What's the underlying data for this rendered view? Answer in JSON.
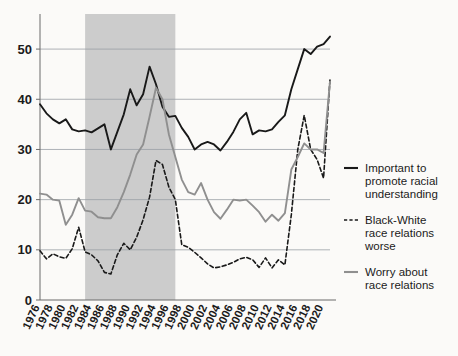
{
  "chart_data": {
    "type": "line",
    "title": "",
    "subtitle": "",
    "xlabel": "",
    "ylabel": "",
    "xlim": [
      1976,
      2021
    ],
    "ylim": [
      0,
      55
    ],
    "yticks": [
      0,
      10,
      20,
      30,
      40,
      50
    ],
    "ytick_labels": [
      "0",
      "10",
      "20",
      "30",
      "40",
      "50"
    ],
    "xticks": [
      1976,
      1978,
      1980,
      1982,
      1984,
      1986,
      1988,
      1990,
      1992,
      1994,
      1996,
      1998,
      2000,
      2002,
      2004,
      2006,
      2008,
      2010,
      2012,
      2014,
      2016,
      2018,
      2020
    ],
    "xtick_labels": [
      "1976",
      "1978",
      "1980",
      "1982",
      "1984",
      "1986",
      "1988",
      "1990",
      "1992",
      "1994",
      "1996",
      "1998",
      "2000",
      "2002",
      "2004",
      "2006",
      "2008",
      "2010",
      "2012",
      "2014",
      "2016",
      "2018",
      "2020"
    ],
    "grid": "horizontal",
    "legend_position": "right",
    "shaded_band": {
      "label": "",
      "x_start": 1983,
      "x_end": 1997,
      "color": "#cccccc"
    },
    "series": [
      {
        "name": "Important to promote racial understanding",
        "style": "solid",
        "color": "#191919",
        "x": [
          1976,
          1977,
          1978,
          1979,
          1980,
          1981,
          1982,
          1983,
          1984,
          1985,
          1986,
          1987,
          1988,
          1989,
          1990,
          1991,
          1992,
          1993,
          1994,
          1995,
          1996,
          1997,
          1998,
          1999,
          2000,
          2001,
          2002,
          2003,
          2004,
          2005,
          2006,
          2007,
          2008,
          2009,
          2010,
          2011,
          2012,
          2013,
          2014,
          2015,
          2016,
          2017,
          2018,
          2019,
          2020,
          2021
        ],
        "y": [
          39.0,
          37.2,
          36.0,
          35.2,
          36.0,
          34.0,
          33.6,
          33.8,
          33.4,
          34.2,
          35.0,
          30.0,
          33.5,
          37.0,
          42.0,
          38.8,
          41.0,
          46.5,
          43.0,
          38.5,
          36.5,
          36.7,
          34.3,
          32.5,
          30.0,
          31.0,
          31.5,
          31.0,
          29.8,
          31.5,
          33.5,
          36.0,
          37.3,
          33.0,
          33.8,
          33.6,
          34.0,
          35.5,
          36.8,
          42.0,
          46.0,
          50.0,
          49.0,
          50.5,
          51.0,
          52.5
        ]
      },
      {
        "name": "Black-White race relations worse",
        "style": "dashed",
        "color": "#191919",
        "x": [
          1976,
          1977,
          1978,
          1979,
          1980,
          1981,
          1982,
          1983,
          1984,
          1985,
          1986,
          1987,
          1988,
          1989,
          1990,
          1991,
          1992,
          1993,
          1994,
          1995,
          1996,
          1997,
          1998,
          1999,
          2000,
          2001,
          2002,
          2003,
          2004,
          2005,
          2006,
          2007,
          2008,
          2009,
          2010,
          2011,
          2012,
          2013,
          2014,
          2015,
          2016,
          2017,
          2018,
          2019,
          2020,
          2021
        ],
        "y": [
          9.8,
          8.2,
          9.2,
          8.6,
          8.3,
          10.2,
          14.5,
          9.6,
          9.0,
          7.8,
          5.5,
          5.2,
          9.0,
          11.3,
          10.0,
          12.5,
          16.0,
          20.5,
          27.8,
          27.0,
          22.5,
          20.0,
          11.0,
          10.5,
          9.5,
          8.4,
          7.2,
          6.4,
          6.6,
          7.0,
          7.5,
          8.2,
          8.5,
          8.0,
          6.5,
          8.4,
          6.4,
          8.0,
          7.0,
          17.0,
          30.0,
          36.8,
          30.0,
          28.0,
          24.3,
          44.0
        ]
      },
      {
        "name": "Worry about race relations",
        "style": "solid",
        "color": "#8f8f8f",
        "x": [
          1976,
          1977,
          1978,
          1979,
          1980,
          1981,
          1982,
          1983,
          1984,
          1985,
          1986,
          1987,
          1988,
          1989,
          1990,
          1991,
          1992,
          1993,
          1994,
          1995,
          1996,
          1997,
          1998,
          1999,
          2000,
          2001,
          2002,
          2003,
          2004,
          2005,
          2006,
          2007,
          2008,
          2009,
          2010,
          2011,
          2012,
          2013,
          2014,
          2015,
          2016,
          2017,
          2018,
          2019,
          2020,
          2021
        ],
        "y": [
          21.2,
          21.0,
          20.0,
          19.8,
          15.0,
          17.0,
          20.3,
          17.8,
          17.6,
          16.5,
          16.3,
          16.3,
          18.5,
          21.5,
          25.0,
          29.0,
          31.0,
          36.5,
          42.3,
          40.0,
          33.0,
          28.5,
          24.0,
          21.5,
          21.0,
          23.3,
          20.0,
          17.5,
          16.2,
          18.0,
          20.0,
          19.8,
          20.0,
          18.8,
          17.5,
          15.6,
          17.0,
          15.8,
          17.3,
          26.0,
          28.5,
          31.2,
          30.0,
          30.0,
          29.3,
          43.5
        ]
      }
    ],
    "legend": [
      {
        "label_lines": [
          "Important to",
          "promote racial",
          "understanding"
        ],
        "style": "solid",
        "color": "#191919"
      },
      {
        "label_lines": [
          "Black-White",
          "race relations",
          "worse"
        ],
        "style": "dashed",
        "color": "#191919"
      },
      {
        "label_lines": [
          "Worry about",
          "race relations"
        ],
        "style": "solid",
        "color": "#8f8f8f"
      }
    ]
  }
}
